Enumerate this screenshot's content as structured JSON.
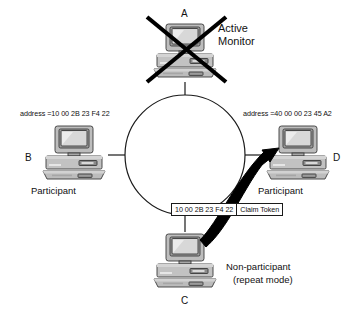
{
  "diagram": {
    "background_color": "#ffffff",
    "ring": {
      "shape": "circle",
      "cx": 185,
      "cy": 155,
      "r": 60,
      "stroke_color": "#1a1a1a"
    },
    "nodes": [
      {
        "id": "A",
        "label": "A",
        "role": "Active Monitor",
        "role_line2": "",
        "address": "",
        "position": "top",
        "failed": true,
        "cross_out": true
      },
      {
        "id": "B",
        "label": "B",
        "role": "Participant",
        "role_line2": "",
        "address": "address =10 00 2B 23 F4 22",
        "position": "left",
        "failed": false,
        "cross_out": false
      },
      {
        "id": "C",
        "label": "C",
        "role": "Non-participant",
        "role_line2": "(repeat mode)",
        "address": "",
        "position": "bottom",
        "failed": false,
        "cross_out": false
      },
      {
        "id": "D",
        "label": "D",
        "role": "Participant",
        "role_line2": "",
        "address": "address =40 00 00 23 45 A2",
        "position": "right",
        "failed": false,
        "cross_out": false
      }
    ],
    "monitor_label": {
      "line1": "Active",
      "line2": "Monitor"
    },
    "frame": {
      "source_address": "10 00 2B 23 F4 22",
      "frame_type": "Claim Token",
      "border_color": "#1a1a1a"
    },
    "arrow": {
      "description": "thick black arrow from node C to node D",
      "color": "#000000",
      "from": "C",
      "to": "D"
    },
    "cross": {
      "color": "#000000",
      "description": "X mark over node A"
    },
    "colors": {
      "ink": "#1a1a1a",
      "pc_body": "#b9b9b9",
      "pc_body_dark": "#8f8f8f",
      "pc_screen": "#d6d6d6",
      "pc_outline": "#3a3a3a",
      "arrow_black": "#000000"
    }
  }
}
